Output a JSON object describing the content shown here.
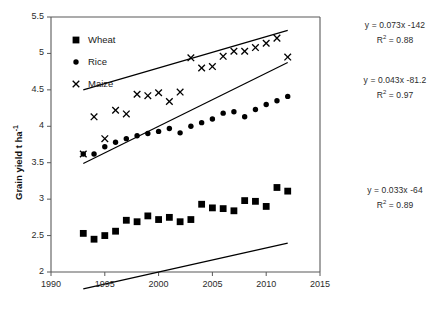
{
  "axes": {
    "ylabel": "Grain yield t ha",
    "ylabel_sup": "-1",
    "y_ticks": [
      "2",
      "2.5",
      "3",
      "3.5",
      "4",
      "4.5",
      "5",
      "5.5"
    ],
    "x_ticks": [
      "1990",
      "1995",
      "2000",
      "2005",
      "2010",
      "2015"
    ]
  },
  "legend": {
    "items": [
      {
        "label": "Wheat",
        "marker": "square"
      },
      {
        "label": "Rice",
        "marker": "circle"
      },
      {
        "label": "Maize",
        "marker": "cross"
      }
    ]
  },
  "annotations": {
    "maize": {
      "equation": "y = 0.073x -142",
      "r2_prefix": "R",
      "r2_sup": "2",
      "r2_value": " = 0.88"
    },
    "rice": {
      "equation": "y = 0.043x -81.2",
      "r2_prefix": "R",
      "r2_sup": "2",
      "r2_value": " = 0.97"
    },
    "wheat": {
      "equation": "y = 0.033x -64",
      "r2_prefix": "R",
      "r2_sup": "2",
      "r2_value": " = 0.89"
    }
  },
  "chart_data": {
    "type": "scatter",
    "title": "",
    "xlabel": "",
    "ylabel": "Grain yield t ha-1",
    "xlim": [
      1990,
      2015
    ],
    "ylim": [
      2,
      5.5
    ],
    "grid": false,
    "legend_position": "inside-top-left",
    "series": [
      {
        "name": "Wheat",
        "marker": "square",
        "color": "#000000",
        "trendline": {
          "equation": "y = 0.033x -64",
          "slope": 0.033,
          "intercept": -64,
          "r2": 0.89,
          "x_start": 1993,
          "x_end": 2012
        },
        "x": [
          1993,
          1994,
          1995,
          1996,
          1997,
          1998,
          1999,
          2000,
          2001,
          2002,
          2003,
          2004,
          2005,
          2006,
          2007,
          2008,
          2009,
          2010,
          2011,
          2012
        ],
        "y": [
          2.53,
          2.45,
          2.5,
          2.56,
          2.71,
          2.69,
          2.77,
          2.72,
          2.75,
          2.69,
          2.72,
          2.93,
          2.88,
          2.87,
          2.84,
          2.98,
          2.97,
          2.9,
          3.16,
          3.11
        ]
      },
      {
        "name": "Rice",
        "marker": "circle",
        "color": "#000000",
        "trendline": {
          "equation": "y = 0.043x -81.2",
          "slope": 0.043,
          "intercept": -81.2,
          "r2": 0.97,
          "x_start": 1993,
          "x_end": 2012
        },
        "x": [
          1993,
          1994,
          1995,
          1996,
          1997,
          1998,
          1999,
          2000,
          2001,
          2002,
          2003,
          2004,
          2005,
          2006,
          2007,
          2008,
          2009,
          2010,
          2011,
          2012
        ],
        "y": [
          3.62,
          3.62,
          3.72,
          3.78,
          3.83,
          3.87,
          3.9,
          3.93,
          3.97,
          3.91,
          4.0,
          4.05,
          4.1,
          4.18,
          4.2,
          4.13,
          4.23,
          4.3,
          4.35,
          4.41
        ]
      },
      {
        "name": "Maize",
        "marker": "cross",
        "color": "#000000",
        "trendline": {
          "equation": "y = 0.073x -142",
          "slope": 0.073,
          "intercept": -142,
          "r2": 0.88,
          "x_start": 1993,
          "x_end": 2012
        },
        "x": [
          1993,
          1994,
          1995,
          1996,
          1997,
          1998,
          1999,
          2000,
          2001,
          2002,
          2003,
          2004,
          2005,
          2006,
          2007,
          2008,
          2009,
          2010,
          2011,
          2012
        ],
        "y": [
          3.62,
          4.13,
          3.83,
          4.22,
          4.17,
          4.44,
          4.42,
          4.46,
          4.34,
          4.47,
          4.94,
          4.8,
          4.82,
          4.96,
          5.03,
          5.03,
          5.08,
          5.14,
          5.21,
          4.95
        ]
      }
    ]
  }
}
